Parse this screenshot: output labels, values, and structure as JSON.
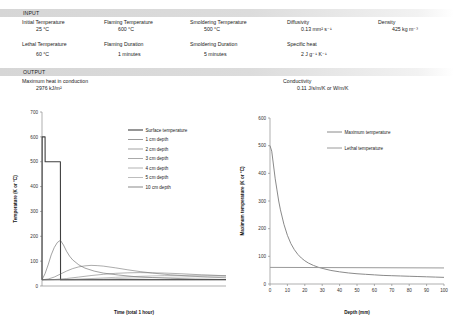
{
  "sections": {
    "input_title": "INPUT",
    "output_title": "OUTPUT"
  },
  "input": {
    "fields": [
      {
        "label": "Initial Temperature",
        "value": "25 °C"
      },
      {
        "label": "Flaming Temperature",
        "value": "600 °C"
      },
      {
        "label": "Smoldering Temperature",
        "value": "500 °C"
      },
      {
        "label": "Diffusivity",
        "value": "0.13 mm² s⁻¹"
      },
      {
        "label": "Density",
        "value": "425 kg m⁻³"
      },
      {
        "label": "Lethal Temperature",
        "value": "60 °C"
      },
      {
        "label": "Flaming Duration",
        "value": "1 minutes"
      },
      {
        "label": "Smoldering Duration",
        "value": "5 minutes"
      },
      {
        "label": "Specific heat",
        "value": "2 J g⁻¹ K⁻¹"
      }
    ]
  },
  "output": {
    "fields": [
      {
        "label": "Maximum heat in conduction",
        "value": "2976 kJ/m²"
      },
      {
        "label": "Conductivity",
        "value": "0.11 J/s/m/K or W/m/K"
      }
    ]
  },
  "chart_data": [
    {
      "type": "line",
      "id": "temperature-vs-time",
      "title": "",
      "xlabel": "Time (total 1 hour)",
      "ylabel": "Temperature (K or °C)",
      "xlim": [
        0,
        60
      ],
      "ylim": [
        0,
        700
      ],
      "yticks": [
        0,
        100,
        200,
        300,
        400,
        500,
        600,
        700
      ],
      "xticks": [],
      "grid": false,
      "legend_position": "upper-right",
      "x_unit": "minutes",
      "series": [
        {
          "name": "Surface temperature",
          "color": "#404040",
          "width": 1.1,
          "points": [
            [
              0,
              25
            ],
            [
              0.05,
              600
            ],
            [
              1,
              600
            ],
            [
              1.02,
              500
            ],
            [
              6,
              500
            ],
            [
              6.05,
              25
            ],
            [
              60,
              25
            ]
          ]
        },
        {
          "name": "1 cm depth",
          "color": "#555555",
          "width": 0.55,
          "points": [
            [
              0,
              25
            ],
            [
              1,
              50
            ],
            [
              2,
              85
            ],
            [
              3,
              125
            ],
            [
              4,
              155
            ],
            [
              5,
              175
            ],
            [
              6,
              184
            ],
            [
              7,
              165
            ],
            [
              8,
              140
            ],
            [
              9,
              120
            ],
            [
              10,
              105
            ],
            [
              12,
              85
            ],
            [
              14,
              72
            ],
            [
              17,
              60
            ],
            [
              20,
              52
            ],
            [
              25,
              44
            ],
            [
              30,
              38
            ],
            [
              36,
              34
            ],
            [
              42,
              31
            ],
            [
              50,
              28
            ],
            [
              60,
              26
            ]
          ]
        },
        {
          "name": "2 cm depth",
          "color": "#666666",
          "width": 0.55,
          "points": [
            [
              0,
              25
            ],
            [
              2,
              28
            ],
            [
              4,
              36
            ],
            [
              6,
              48
            ],
            [
              8,
              60
            ],
            [
              10,
              70
            ],
            [
              12,
              77
            ],
            [
              14,
              81
            ],
            [
              16,
              83
            ],
            [
              18,
              82
            ],
            [
              20,
              80
            ],
            [
              24,
              73
            ],
            [
              28,
              65
            ],
            [
              32,
              58
            ],
            [
              36,
              52
            ],
            [
              42,
              45
            ],
            [
              48,
              40
            ],
            [
              54,
              36
            ],
            [
              60,
              33
            ]
          ]
        },
        {
          "name": "3 cm depth",
          "color": "#707070",
          "width": 0.55,
          "points": [
            [
              0,
              25
            ],
            [
              4,
              26
            ],
            [
              8,
              30
            ],
            [
              12,
              36
            ],
            [
              16,
              42
            ],
            [
              20,
              47
            ],
            [
              24,
              51
            ],
            [
              28,
              53
            ],
            [
              32,
              54
            ],
            [
              36,
              53
            ],
            [
              40,
              52
            ],
            [
              46,
              49
            ],
            [
              52,
              45
            ],
            [
              60,
              41
            ]
          ]
        },
        {
          "name": "4 cm depth",
          "color": "#808080",
          "width": 0.5,
          "points": [
            [
              0,
              25
            ],
            [
              8,
              26
            ],
            [
              16,
              30
            ],
            [
              24,
              35
            ],
            [
              32,
              39
            ],
            [
              40,
              42
            ],
            [
              48,
              43
            ],
            [
              54,
              43
            ],
            [
              60,
              42
            ]
          ]
        },
        {
          "name": "5 cm depth",
          "color": "#909090",
          "width": 0.5,
          "points": [
            [
              0,
              25
            ],
            [
              10,
              25.5
            ],
            [
              20,
              28
            ],
            [
              30,
              32
            ],
            [
              40,
              35
            ],
            [
              50,
              37
            ],
            [
              60,
              37
            ]
          ]
        },
        {
          "name": "10 cm depth",
          "color": "#3a3a3a",
          "width": 0.5,
          "points": [
            [
              0,
              25
            ],
            [
              20,
              25
            ],
            [
              40,
              25.3
            ],
            [
              60,
              25.8
            ]
          ]
        }
      ]
    },
    {
      "type": "line",
      "id": "max-temperature-vs-depth",
      "title": "",
      "xlabel": "Depth (mm)",
      "ylabel": "Maximum temperature (K or °C)",
      "xlim": [
        0,
        100
      ],
      "ylim": [
        0,
        600
      ],
      "yticks": [
        0,
        100,
        200,
        300,
        400,
        500,
        600
      ],
      "xticks": [
        0,
        10,
        20,
        30,
        40,
        50,
        60,
        70,
        80,
        90,
        100
      ],
      "grid": false,
      "legend_position": "upper-right",
      "series": [
        {
          "name": "Maximum temperature",
          "color": "#8a8a8a",
          "width": 1.0,
          "points": [
            [
              0,
              500
            ],
            [
              1,
              480
            ],
            [
              2,
              430
            ],
            [
              3,
              380
            ],
            [
              4,
              340
            ],
            [
              5,
              300
            ],
            [
              6,
              268
            ],
            [
              8,
              216
            ],
            [
              10,
              176
            ],
            [
              12,
              146
            ],
            [
              14,
              124
            ],
            [
              16,
              107
            ],
            [
              18,
              94
            ],
            [
              20,
              84
            ],
            [
              22,
              76
            ],
            [
              25,
              67
            ],
            [
              28,
              60
            ],
            [
              31,
              55
            ],
            [
              35,
              49
            ],
            [
              40,
              44
            ],
            [
              45,
              40
            ],
            [
              50,
              37
            ],
            [
              55,
              35
            ],
            [
              60,
              33
            ],
            [
              65,
              31
            ],
            [
              70,
              30
            ],
            [
              75,
              29
            ],
            [
              80,
              28
            ],
            [
              85,
              27
            ],
            [
              90,
              26
            ],
            [
              95,
              25
            ],
            [
              100,
              24
            ]
          ]
        },
        {
          "name": "Lethal temperature",
          "color": "#9a9a9a",
          "width": 1.0,
          "points": [
            [
              0,
              60
            ],
            [
              100,
              58
            ]
          ]
        }
      ]
    }
  ]
}
